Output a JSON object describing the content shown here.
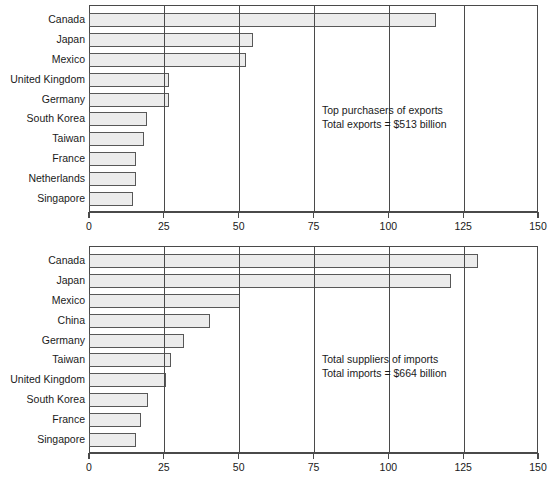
{
  "chart_data": [
    {
      "type": "bar",
      "orientation": "horizontal",
      "id": "exports",
      "title": "",
      "annotation": [
        "Top purchasers of exports",
        "Total exports = $513 billion"
      ],
      "xlabel": "",
      "ylabel": "",
      "xlim": [
        0,
        150
      ],
      "xticks": [
        0,
        25,
        50,
        75,
        100,
        125,
        150
      ],
      "xticklabels": [
        "0",
        "25",
        "50",
        "75",
        "100",
        "125",
        "150"
      ],
      "grid": "vertical",
      "legend": "none",
      "categories": [
        "Canada",
        "Japan",
        "Mexico",
        "United Kingdom",
        "Germany",
        "South Korea",
        "Taiwan",
        "France",
        "Netherlands",
        "Singapore"
      ],
      "values": [
        115.5,
        54.5,
        52,
        26.5,
        26.5,
        19,
        18,
        15.5,
        15.5,
        14.5
      ]
    },
    {
      "type": "bar",
      "orientation": "horizontal",
      "id": "imports",
      "title": "",
      "annotation": [
        "Total suppliers of imports",
        "Total imports = $664 billion"
      ],
      "xlabel": "",
      "ylabel": "",
      "xlim": [
        0,
        150
      ],
      "xticks": [
        0,
        25,
        50,
        75,
        100,
        125,
        150
      ],
      "xticklabels": [
        "0",
        "25",
        "50",
        "75",
        "100",
        "125",
        "150"
      ],
      "grid": "vertical",
      "legend": "none",
      "categories": [
        "Canada",
        "Japan",
        "Mexico",
        "China",
        "Germany",
        "Taiwan",
        "United Kingdom",
        "South Korea",
        "France",
        "Singapore"
      ],
      "values": [
        129.5,
        120.5,
        50,
        40,
        31.5,
        27,
        25.5,
        19.5,
        17,
        15.5
      ]
    }
  ],
  "colors": {
    "bar_fill": "#ececec",
    "bar_border": "#585858",
    "axis": "#4a4a4a",
    "text": "#1a1a1a",
    "background": "#ffffff"
  }
}
